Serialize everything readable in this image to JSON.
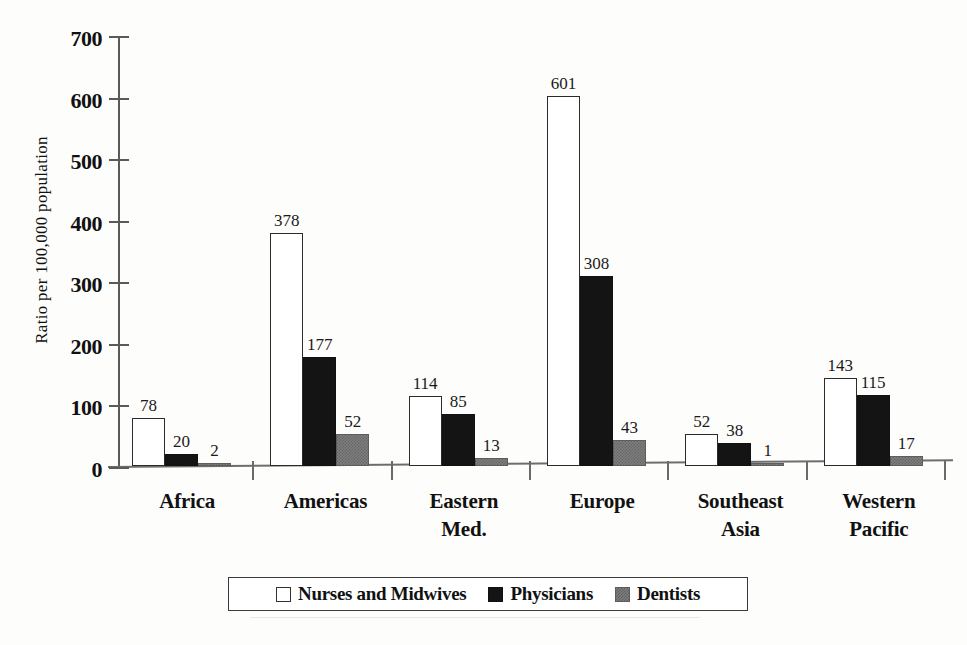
{
  "chart_data": {
    "type": "bar",
    "title": "",
    "xlabel": "",
    "ylabel": "Ratio per 100,000 population",
    "ylim": [
      0,
      700
    ],
    "ytick_values": [
      0,
      100,
      200,
      300,
      400,
      500,
      600,
      700
    ],
    "ytick_labels": [
      "0",
      "100",
      "200",
      "300",
      "400",
      "500",
      "600",
      "700"
    ],
    "grid": false,
    "legend_position": "bottom",
    "categories": [
      "Africa",
      "Americas",
      "Eastern Med.",
      "Europe",
      "Southeast Asia",
      "Western Pacific"
    ],
    "category_lines": [
      [
        "Africa"
      ],
      [
        "Americas"
      ],
      [
        "Eastern",
        "Med."
      ],
      [
        "Europe"
      ],
      [
        "Southeast",
        "Asia"
      ],
      [
        "Western",
        "Pacific"
      ]
    ],
    "series": [
      {
        "name": "Nurses and Midwives",
        "key": "nurses",
        "color": "#ffffff",
        "values": [
          78,
          378,
          114,
          601,
          52,
          143
        ]
      },
      {
        "name": "Physicians",
        "key": "phys",
        "color": "#141414",
        "values": [
          20,
          177,
          85,
          308,
          38,
          115
        ]
      },
      {
        "name": "Dentists",
        "key": "dent",
        "color": "#7e7e7e",
        "values": [
          2,
          52,
          13,
          43,
          1,
          17
        ]
      }
    ]
  },
  "legend": {
    "items": [
      {
        "label": "Nurses and Midwives",
        "swatch": "nurses"
      },
      {
        "label": "Physicians",
        "swatch": "phys"
      },
      {
        "label": "Dentists",
        "swatch": "dent"
      }
    ]
  },
  "colors": {
    "nurses": "#ffffff",
    "physicians": "#141414",
    "dentists": "#7e7e7e",
    "axis": "#5a5a5a",
    "background": "#fdfdfc"
  },
  "caption": ""
}
